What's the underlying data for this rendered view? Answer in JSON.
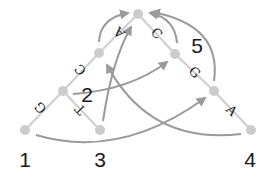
{
  "diagram": {
    "type": "rna-secondary-structure-arc-diagram",
    "colors": {
      "background": "#ffffff",
      "stem": "#cfcfcf",
      "node": "#cccccc",
      "arc": "#9a9a9a",
      "text": "#1a1a1a"
    },
    "nodes": [
      {
        "id": "n1",
        "x": 25,
        "y": 130
      },
      {
        "id": "a",
        "x": 63,
        "y": 91
      },
      {
        "id": "b",
        "x": 99,
        "y": 53
      },
      {
        "id": "top",
        "x": 138,
        "y": 14
      },
      {
        "id": "c",
        "x": 175,
        "y": 54
      },
      {
        "id": "d",
        "x": 214,
        "y": 91
      },
      {
        "id": "n4",
        "x": 251,
        "y": 130
      },
      {
        "id": "n3",
        "x": 100,
        "y": 130
      }
    ],
    "edge_letters": [
      {
        "label": "G",
        "between": [
          "n1",
          "a"
        ]
      },
      {
        "label": "C",
        "between": [
          "a",
          "b"
        ]
      },
      {
        "label": "A",
        "between": [
          "b",
          "top"
        ]
      },
      {
        "label": "C",
        "between": [
          "top",
          "c"
        ]
      },
      {
        "label": "G",
        "between": [
          "c",
          "d"
        ]
      },
      {
        "label": "A",
        "between": [
          "d",
          "n4"
        ]
      },
      {
        "label": "T",
        "between": [
          "a",
          "n3"
        ]
      }
    ],
    "node_labels": [
      {
        "label": "1",
        "node": "n1"
      },
      {
        "label": "2",
        "node": "a"
      },
      {
        "label": "3",
        "node": "n3"
      },
      {
        "label": "4",
        "node": "n4"
      },
      {
        "label": "5",
        "node": "d"
      }
    ],
    "labels": {
      "one": "1",
      "two": "2",
      "three": "3",
      "four": "4",
      "five": "5",
      "g1": "G",
      "c1": "C",
      "a1": "A",
      "c2": "C",
      "g2": "G",
      "a2": "A",
      "t1": "T"
    }
  }
}
